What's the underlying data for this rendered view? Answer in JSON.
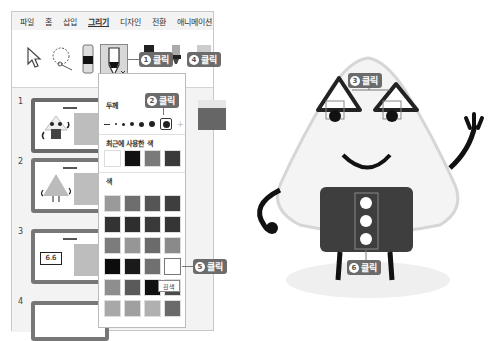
{
  "menubar": {
    "tabs": [
      {
        "label": "파일",
        "active": false
      },
      {
        "label": "홈",
        "active": false
      },
      {
        "label": "삽입",
        "active": false
      },
      {
        "label": "그리기",
        "active": true
      },
      {
        "label": "디자인",
        "active": false
      },
      {
        "label": "전환",
        "active": false
      },
      {
        "label": "애니메이션",
        "active": false
      }
    ]
  },
  "ribbon": {
    "tools": [
      {
        "icon": "select-arrow-icon"
      },
      {
        "icon": "lasso-select-icon"
      },
      {
        "icon": "pen-1-icon"
      },
      {
        "icon": "pen-2-selected-icon"
      },
      {
        "icon": "pen-3-icon"
      },
      {
        "icon": "pen-4-icon"
      },
      {
        "icon": "highlighter-icon"
      }
    ]
  },
  "callouts": {
    "c1": {
      "num": "1",
      "label": "클릭"
    },
    "c2": {
      "num": "2",
      "label": "클릭"
    },
    "c3": {
      "num": "3",
      "label": "클릭"
    },
    "c4": {
      "num": "4",
      "label": "클릭"
    },
    "c5": {
      "num": "5",
      "label": "클릭"
    },
    "c6": {
      "num": "6",
      "label": "클릭"
    }
  },
  "slides": [
    {
      "num": "1",
      "selected": true
    },
    {
      "num": "2",
      "selected": false
    },
    {
      "num": "3",
      "selected": false
    },
    {
      "num": "4",
      "selected": false
    }
  ],
  "pen_menu": {
    "thickness_label": "두께",
    "recent_label": "최근에 사용한 색",
    "colors_label": "색",
    "recent_colors": [
      "#ffffff",
      "#111111",
      "#7a7a7a",
      "#3a3a3a"
    ],
    "colors": [
      [
        "#9a9a9a",
        "#6e6e6e",
        "#555555",
        "#3e3e3e"
      ],
      [
        "#333333",
        "#2e2e2e",
        "#3a3a3a",
        "#353535"
      ],
      [
        "#7c7c7c",
        "#969696",
        "#6b6b6b",
        "#8a8a8a"
      ],
      [
        "#0c0c0c",
        "#1a1a1a",
        "#707070",
        "#ffffff"
      ],
      [
        "#8e8e8e",
        "#5a5a5a",
        "#111111",
        "#4a4a4a"
      ],
      [
        "#a8a8a8",
        "#a0a0a0",
        "#b0b0b0",
        "#6a6a6a"
      ]
    ],
    "tooltip": "흰색"
  }
}
